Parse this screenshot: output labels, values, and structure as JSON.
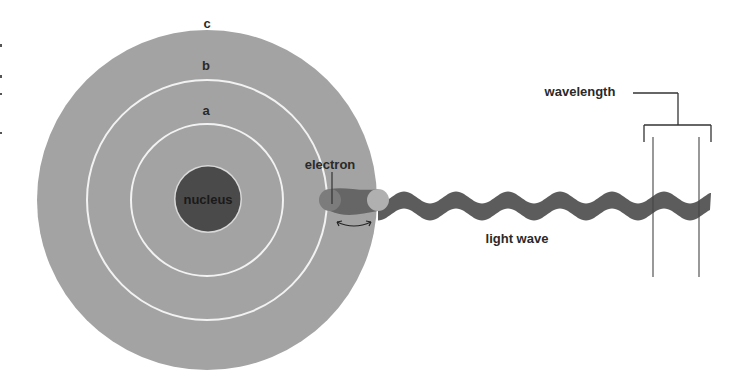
{
  "diagram": {
    "colors": {
      "background": "#ffffff",
      "atom_disc": "#a3a3a3",
      "orbit_ring": "#f2f2f2",
      "nucleus": "#4a4a4a",
      "nucleus_rim": "#d9d9d9",
      "electron_inner": "#7c7c7c",
      "electron_outer": "#b0b0b0",
      "wave": "#5c5c5c",
      "line": "#333333",
      "label": "#2a2a2a"
    },
    "labels": {
      "orbit_c": "c",
      "orbit_b": "b",
      "orbit_a": "a",
      "nucleus": "nucleus",
      "electron": "electron",
      "light_wave": "light wave",
      "wavelength": "wavelength"
    },
    "atom": {
      "center": [
        207,
        200
      ],
      "disc_radius": 170,
      "orbits": [
        {
          "name": "a",
          "radius": 76
        },
        {
          "name": "b",
          "radius": 120
        },
        {
          "name": "c",
          "radius": 170
        }
      ],
      "nucleus_radius": 33
    },
    "electron_positions": [
      {
        "name": "inner",
        "x": 330,
        "y": 200,
        "r": 11
      },
      {
        "name": "outer",
        "x": 378,
        "y": 200,
        "r": 11
      }
    ],
    "wave": {
      "start_x": 378,
      "end_x": 711,
      "center_y": 206,
      "amplitude": 6,
      "period": 52,
      "thickness": 17
    },
    "wavelength_marker": {
      "left_x": 652,
      "right_x": 698,
      "top_y": 142,
      "bottom_y": 277
    }
  }
}
